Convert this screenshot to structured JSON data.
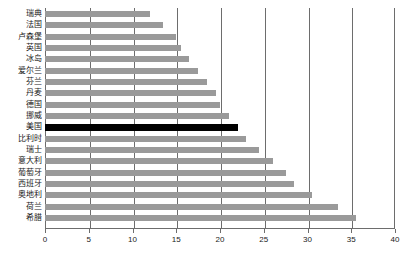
{
  "chart_data": {
    "type": "bar",
    "orientation": "horizontal",
    "title": "",
    "xlabel": "",
    "ylabel": "",
    "xlim": [
      0,
      40
    ],
    "xticks": [
      "0",
      "5",
      "10",
      "15",
      "20",
      "25",
      "30",
      "35",
      "40"
    ],
    "xtick_values": [
      0,
      5,
      10,
      15,
      20,
      25,
      30,
      35,
      40
    ],
    "grid": true,
    "legend": null,
    "highlight_category": "美国",
    "highlight_color": "#000000",
    "bar_color": "#9a9a9a",
    "categories": [
      "瑞典",
      "法国",
      "卢森堡",
      "英国",
      "冰岛",
      "爱尔兰",
      "芬兰",
      "丹麦",
      "德国",
      "挪威",
      "美国",
      "比利时",
      "瑞士",
      "意大利",
      "葡萄牙",
      "西班牙",
      "奥地利",
      "荷兰",
      "希腊"
    ],
    "values": [
      12.0,
      13.5,
      15.0,
      15.5,
      16.5,
      17.5,
      18.5,
      19.5,
      20.0,
      21.0,
      22.0,
      23.0,
      24.5,
      26.0,
      27.5,
      28.5,
      30.5,
      33.5,
      35.5
    ]
  }
}
